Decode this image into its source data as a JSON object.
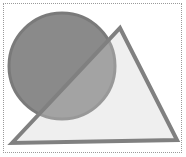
{
  "diagram": {
    "colors": {
      "frame_border": "#9a9a9a",
      "circle_fill": "#8a8a8a",
      "circle_stroke": "#7a7a7a",
      "triangle_fill": "#d2d2d2",
      "triangle_stroke": "#808080"
    },
    "shapes": [
      {
        "type": "circle",
        "cx": 62,
        "cy": 66,
        "r": 53
      },
      {
        "type": "triangle",
        "points": "12,143 120,28 177,140"
      }
    ]
  }
}
